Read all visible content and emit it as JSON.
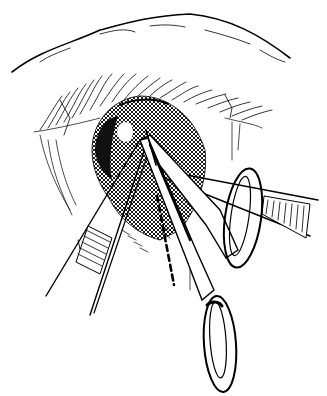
{
  "image": {
    "width": 327,
    "height": 396,
    "background": "#ffffff",
    "ink": "#000000",
    "style": "black-and-white surgical line drawing",
    "subject": "eyelid surgery with forceps and scissors incising along a dashed line below the eye",
    "elements": [
      {
        "name": "brow-fold",
        "description": "upper skin fold / brow contour"
      },
      {
        "name": "eyelashes",
        "description": "row of upper eyelid lashes"
      },
      {
        "name": "shaded-tissue",
        "description": "cross-hatched dark tissue region around incision"
      },
      {
        "name": "dashed-incision-line",
        "description": "vertical dashed line marking incision path"
      },
      {
        "name": "left-forceps",
        "description": "toothed forceps entering from lower left"
      },
      {
        "name": "right-forceps",
        "description": "forceps with serrated grip entering from right"
      },
      {
        "name": "scissors",
        "description": "scissors with two finger rings, one upper right, one bottom center"
      }
    ]
  }
}
